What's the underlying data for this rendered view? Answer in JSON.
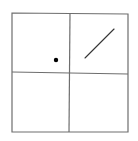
{
  "diagram": {
    "type": "2x2-grid",
    "colors": {
      "background": "#ffffff",
      "grid_line": "#6e6e6e",
      "dot": "#000000",
      "segment": "#333333"
    },
    "frame": {
      "x1": 12,
      "y1": 13,
      "x2": 128,
      "y2": 132
    },
    "dividers": {
      "vertical": {
        "x1": 70,
        "y1": 13,
        "x2": 69,
        "y2": 132
      },
      "horizontal": {
        "x1": 12,
        "y1": 72,
        "x2": 128,
        "y2": 74
      }
    },
    "cells": [
      {
        "position": "top-left",
        "contents": "dot"
      },
      {
        "position": "top-right",
        "contents": "diagonal-line"
      },
      {
        "position": "bottom-left",
        "contents": "empty"
      },
      {
        "position": "bottom-right",
        "contents": "empty"
      }
    ],
    "dot": {
      "cx": 56,
      "cy": 60,
      "r": 2.2
    },
    "segment": {
      "x1": 85,
      "y1": 58,
      "x2": 114,
      "y2": 29
    }
  }
}
